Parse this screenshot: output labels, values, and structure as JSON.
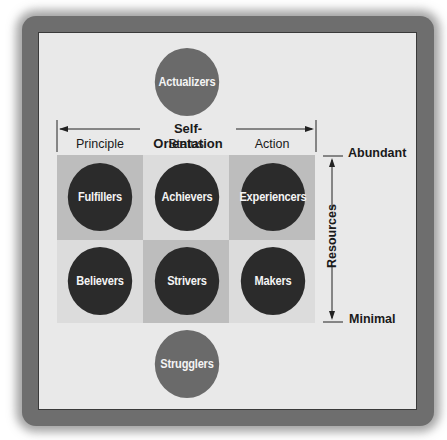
{
  "diagram": {
    "top_segment": "Actualizers",
    "bottom_segment": "Strugglers",
    "horizontal_axis": {
      "title": "Self-Orientation",
      "columns": [
        "Principle",
        "Status",
        "Action"
      ]
    },
    "vertical_axis": {
      "title": "Resources",
      "top_label": "Abundant",
      "bottom_label": "Minimal"
    },
    "grid": [
      [
        "Fulfillers",
        "Achievers",
        "Experiencers"
      ],
      [
        "Believers",
        "Strivers",
        "Makers"
      ]
    ],
    "colors": {
      "panel_bg": "#e9e9e9",
      "cell_shaded": "#bdbdbd",
      "cell_light": "#dcdcdc",
      "circle_dark": "#2b2b2b",
      "circle_gray": "#6a6a6a",
      "text_light": "#f4f4f4"
    }
  }
}
